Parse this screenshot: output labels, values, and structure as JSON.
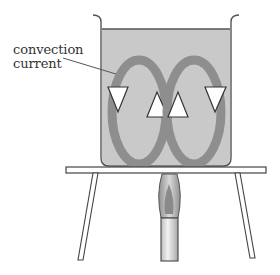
{
  "diagram": {
    "labels": {
      "convection_line1": "convection",
      "convection_line2": "current"
    },
    "components": [
      "beaker",
      "water",
      "convection-loop-left",
      "convection-loop-right",
      "tripod",
      "bunsen-burner-flame",
      "bunsen-burner"
    ],
    "colors": {
      "water": "#c9c9c9",
      "loop": "#8e8e8e",
      "outline": "#555555",
      "arrow_fill": "#ffffff",
      "flame": "#9a9a9a",
      "burner": "#dcdcdc"
    }
  }
}
